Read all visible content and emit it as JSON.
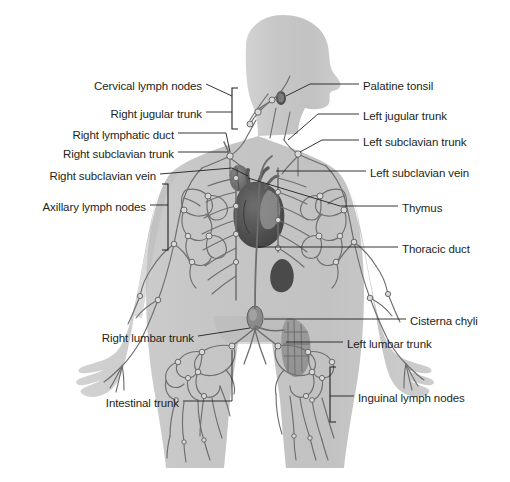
{
  "figure": {
    "background_color": "#ffffff",
    "body_fill": "#c9c9c9",
    "body_fill_dark": "#bdbdbd",
    "vessel_color": "#6e6e6e",
    "node_fill": "#d9d9d9",
    "organ_dark": "#555555",
    "organ_mid": "#7a7a7a",
    "leader_color": "#231f20",
    "text_color": "#231f20"
  },
  "labels_left": [
    {
      "id": "cervical-lymph-nodes",
      "text": "Cervical lymph nodes",
      "x": 78,
      "y": 80,
      "w": 124
    },
    {
      "id": "right-jugular-trunk",
      "text": "Right jugular trunk",
      "x": 88,
      "y": 108,
      "w": 114
    },
    {
      "id": "right-lymphatic-duct",
      "text": "Right lymphatic duct",
      "x": 50,
      "y": 129,
      "w": 124
    },
    {
      "id": "right-subclavian-trunk",
      "text": "Right subclavian trunk",
      "x": 36,
      "y": 148,
      "w": 138
    },
    {
      "id": "right-subclavian-vein",
      "text": "Right subclavian vein",
      "x": 20,
      "y": 170,
      "w": 136
    },
    {
      "id": "axillary-lymph-nodes",
      "text": "Axillary lymph nodes",
      "x": 18,
      "y": 201,
      "w": 128
    },
    {
      "id": "right-lumbar-trunk",
      "text": "Right lumbar trunk",
      "x": 78,
      "y": 332,
      "w": 116
    },
    {
      "id": "intestinal-trunk",
      "text": "Intestinal trunk",
      "x": 85,
      "y": 397,
      "w": 94
    }
  ],
  "labels_right": [
    {
      "id": "palatine-tonsil",
      "text": "Palatine tonsil",
      "x": 363,
      "y": 80
    },
    {
      "id": "left-jugular-trunk",
      "text": "Left jugular trunk",
      "x": 363,
      "y": 110
    },
    {
      "id": "left-subclavian-trunk",
      "text": "Left subclavian trunk",
      "x": 363,
      "y": 136
    },
    {
      "id": "left-subclavian-vein",
      "text": "Left subclavian vein",
      "x": 370,
      "y": 167
    },
    {
      "id": "thymus",
      "text": "Thymus",
      "x": 402,
      "y": 202
    },
    {
      "id": "thoracic-duct",
      "text": "Thoracic duct",
      "x": 402,
      "y": 243
    },
    {
      "id": "cisterna-chyli",
      "text": "Cisterna chyli",
      "x": 410,
      "y": 315
    },
    {
      "id": "left-lumbar-trunk",
      "text": "Left lumbar trunk",
      "x": 347,
      "y": 338
    },
    {
      "id": "inguinal-lymph-nodes",
      "text": "Inguinal lymph nodes",
      "x": 358,
      "y": 392
    }
  ],
  "brackets": [
    {
      "id": "cervical-bracket",
      "x": 232,
      "y_top": 88,
      "y_bottom": 129,
      "facing": "left"
    },
    {
      "id": "axillary-bracket",
      "x": 168,
      "y_top": 184,
      "y_bottom": 250,
      "facing": "right"
    },
    {
      "id": "inguinal-bracket",
      "x": 330,
      "y_top": 367,
      "y_bottom": 422,
      "facing": "left"
    }
  ],
  "organs": [
    {
      "id": "palatine-tonsil-node",
      "cx": 281,
      "cy": 98,
      "rx": 5,
      "ry": 7
    },
    {
      "id": "thymus",
      "cx": 240,
      "cy": 177,
      "rx": 9,
      "ry": 11
    },
    {
      "id": "heart",
      "cx": 258,
      "cy": 214,
      "rx": 26,
      "ry": 30
    },
    {
      "id": "spleen",
      "cx": 283,
      "cy": 275,
      "rx": 11,
      "ry": 14
    },
    {
      "id": "cisterna-chyli",
      "cx": 255,
      "cy": 318,
      "rx": 8,
      "ry": 12
    }
  ]
}
